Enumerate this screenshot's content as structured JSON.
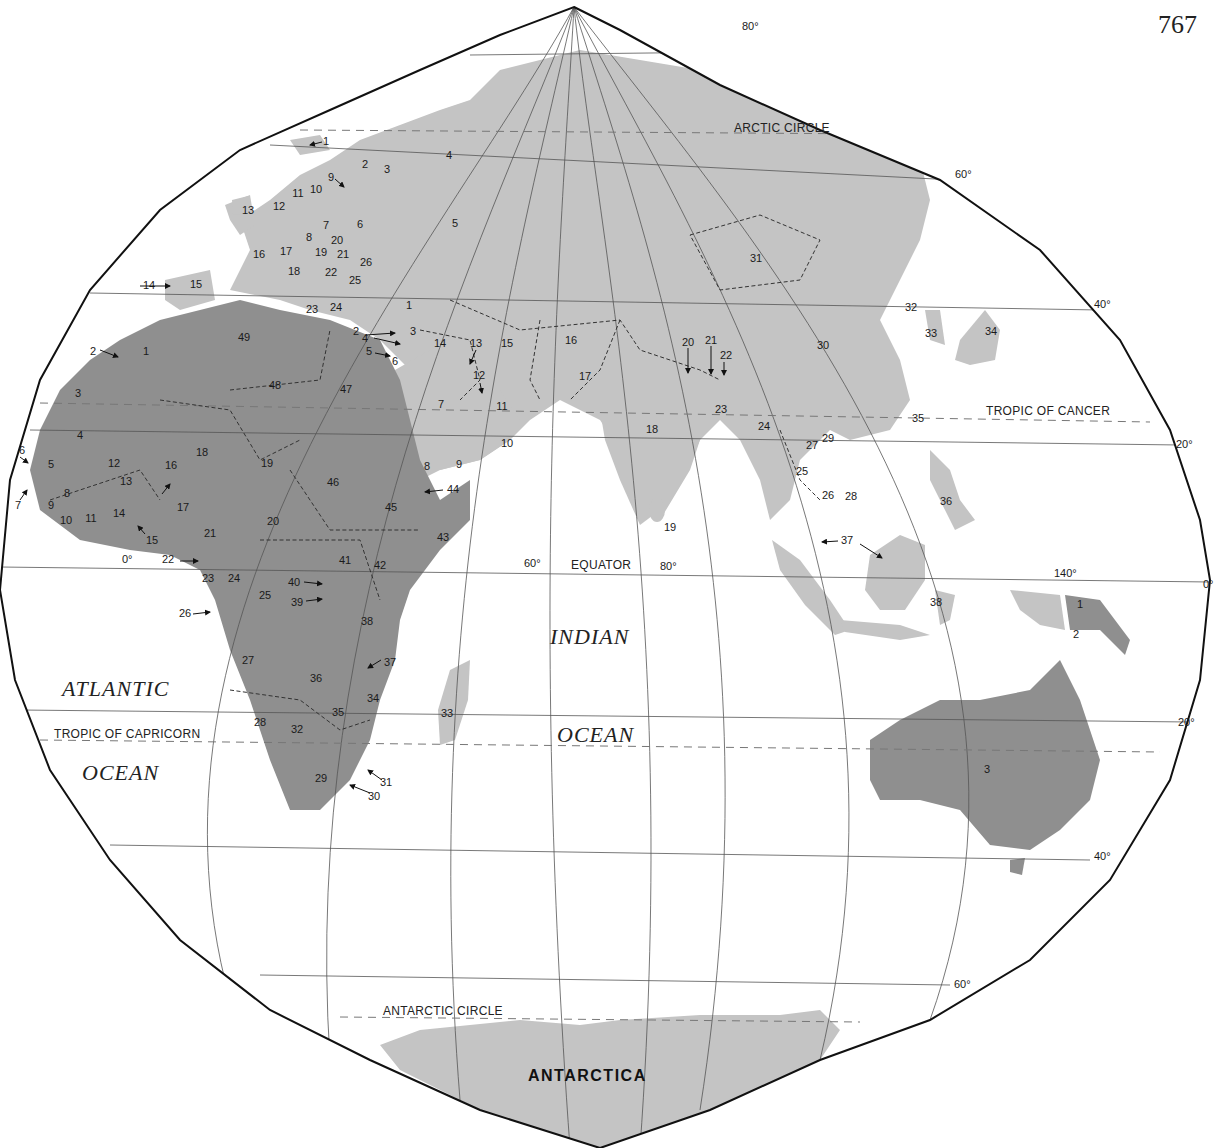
{
  "page_number": "767",
  "map": {
    "oceans": {
      "atlantic_1": "ATLANTIC",
      "atlantic_2": "OCEAN",
      "indian_1": "INDIAN",
      "indian_2": "OCEAN"
    },
    "continent_labels": {
      "antarctica": "ANTARCTICA"
    },
    "lines": {
      "arctic_circle": "ARCTIC CIRCLE",
      "tropic_cancer": "TROPIC OF CANCER",
      "equator": "EQUATOR",
      "tropic_capricorn": "TROPIC OF CAPRICORN",
      "antarctic_circle": "ANTARCTIC CIRCLE"
    },
    "degrees": {
      "lat_80": "80°",
      "lat_60n": "60°",
      "lat_40n": "40°",
      "lat_20n": "20°",
      "lat_0": "0°",
      "lat_20s": "20°",
      "lat_40s": "40°",
      "lat_60s": "60°",
      "lon_0": "0°",
      "lon_60": "60°",
      "lon_80": "80°",
      "lon_140": "140°"
    },
    "europe": [
      "1",
      "2",
      "3",
      "4",
      "5",
      "6",
      "7",
      "8",
      "9",
      "10",
      "11",
      "12",
      "13",
      "14",
      "15",
      "16",
      "17",
      "18",
      "19",
      "20",
      "21",
      "22",
      "23",
      "24",
      "25",
      "26"
    ],
    "africa": [
      "1",
      "2",
      "3",
      "4",
      "5",
      "6",
      "7",
      "8",
      "9",
      "10",
      "11",
      "12",
      "13",
      "14",
      "15",
      "16",
      "17",
      "18",
      "19",
      "20",
      "21",
      "22",
      "23",
      "24",
      "25",
      "26",
      "27",
      "28",
      "29",
      "30",
      "31",
      "32",
      "33",
      "34",
      "35",
      "36",
      "37",
      "38",
      "39",
      "40",
      "41",
      "42",
      "43",
      "44",
      "45",
      "46",
      "47",
      "48",
      "49"
    ],
    "asia": [
      "1",
      "2",
      "3",
      "4",
      "5",
      "6",
      "7",
      "8",
      "9",
      "10",
      "11",
      "12",
      "13",
      "14",
      "15",
      "16",
      "17",
      "18",
      "19",
      "20",
      "21",
      "22",
      "23",
      "24",
      "25",
      "26",
      "27",
      "28",
      "29",
      "30",
      "31",
      "32",
      "33",
      "34",
      "35",
      "36",
      "37",
      "38"
    ],
    "oceania": [
      "1",
      "2",
      "3"
    ]
  }
}
